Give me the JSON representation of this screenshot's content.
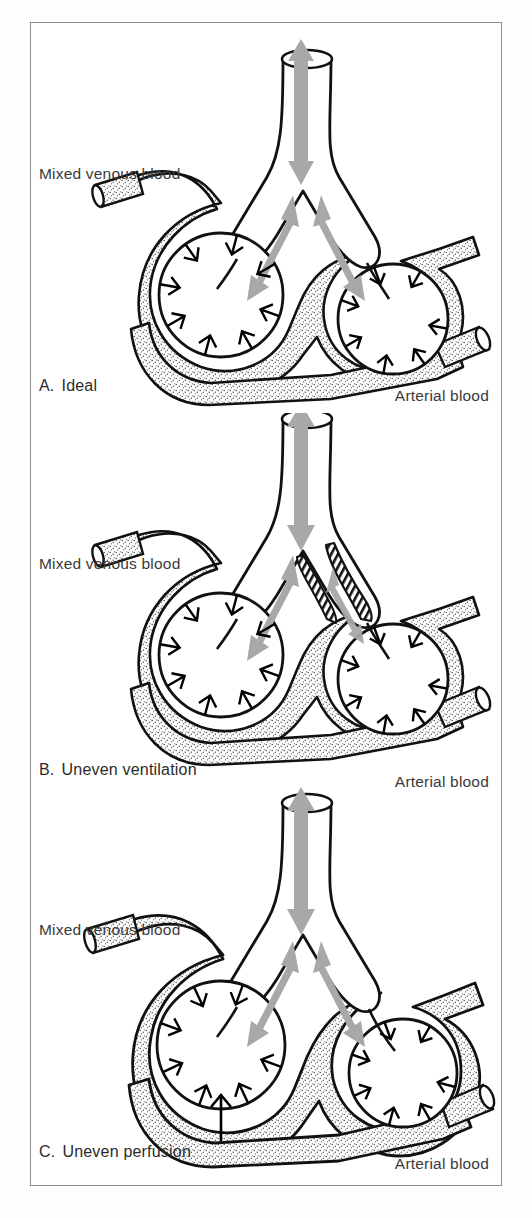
{
  "figure": {
    "frame_color": "#8d8d8d",
    "background_color": "#ffffff",
    "airflow_arrow_color": "#a8a8a8",
    "gas_exchange_arrow_color": "#000000",
    "vessel_fill": "stipple-texture",
    "text_color": "#3a3a3a"
  },
  "panels": [
    {
      "id": "A",
      "letter": "A.",
      "caption": "Ideal",
      "mixed_venous_label": "Mixed venous blood",
      "arterial_label": "Arterial blood",
      "condition": "normal ventilation and normal perfusion to both alveoli",
      "airway_obstruction": false,
      "perfusion_balanced": true
    },
    {
      "id": "B",
      "letter": "B.",
      "caption": "Uneven ventilation",
      "mixed_venous_label": "Mixed venous blood",
      "arterial_label": "Arterial blood",
      "condition": "right bronchus narrowed by hatched obstruction, reduced airflow to right alveolus",
      "airway_obstruction": true,
      "perfusion_balanced": true
    },
    {
      "id": "C",
      "letter": "C.",
      "caption": "Uneven perfusion",
      "mixed_venous_label": "Mixed venous blood",
      "arterial_label": "Arterial blood",
      "condition": "right capillary bed enlarged, greater blood flow to right alveolus",
      "airway_obstruction": false,
      "perfusion_balanced": false
    }
  ]
}
